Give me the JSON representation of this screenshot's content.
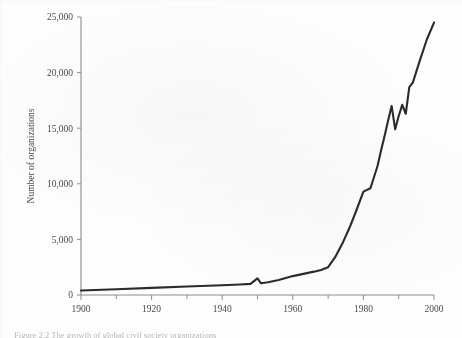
{
  "figure": {
    "caption": "Figure 2.2  The growth of global civil society organizations"
  },
  "chart_data": {
    "type": "line",
    "title": "",
    "xlabel": "",
    "ylabel": "Number of organizations",
    "xlim": [
      1900,
      2000
    ],
    "ylim": [
      0,
      25000
    ],
    "xticks": [
      1900,
      1920,
      1940,
      1960,
      1980,
      2000
    ],
    "xtick_labels": [
      "1900",
      "1920",
      "1940",
      "1960",
      "1980",
      "2000"
    ],
    "xminorticks": [
      1910,
      1930,
      1950,
      1970,
      1990
    ],
    "yticks": [
      0,
      5000,
      10000,
      15000,
      20000,
      25000
    ],
    "ytick_labels": [
      "0",
      "5,000",
      "10,000",
      "15,000",
      "20,000",
      "25,000"
    ],
    "grid": false,
    "legend": "none",
    "line_color": "#2b2b2b",
    "series": [
      {
        "name": "Global civil society organizations",
        "x": [
          1900,
          1910,
          1920,
          1930,
          1940,
          1945,
          1948,
          1950,
          1951,
          1953,
          1956,
          1960,
          1963,
          1966,
          1968,
          1970,
          1972,
          1974,
          1976,
          1978,
          1980,
          1982,
          1984,
          1985,
          1986,
          1987,
          1988,
          1989,
          1990,
          1991,
          1992,
          1993,
          1994,
          1996,
          1998,
          2000
        ],
        "values": [
          400,
          520,
          640,
          760,
          880,
          950,
          1000,
          1500,
          1050,
          1150,
          1350,
          1700,
          1900,
          2100,
          2250,
          2500,
          3400,
          4600,
          6000,
          7600,
          9300,
          9600,
          11600,
          13000,
          14300,
          15700,
          17000,
          14900,
          16100,
          17100,
          16300,
          18700,
          19100,
          21100,
          23000,
          24500
        ]
      }
    ]
  }
}
